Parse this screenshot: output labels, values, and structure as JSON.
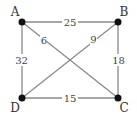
{
  "graph": {
    "nodes": [
      {
        "id": "A",
        "label": "A"
      },
      {
        "id": "B",
        "label": "B"
      },
      {
        "id": "C",
        "label": "C"
      },
      {
        "id": "D",
        "label": "D"
      }
    ],
    "edges": [
      {
        "from": "A",
        "to": "B",
        "weight": "25"
      },
      {
        "from": "B",
        "to": "C",
        "weight": "18"
      },
      {
        "from": "C",
        "to": "D",
        "weight": "15"
      },
      {
        "from": "D",
        "to": "A",
        "weight": "32"
      },
      {
        "from": "A",
        "to": "C",
        "weight": "6"
      },
      {
        "from": "B",
        "to": "D",
        "weight": "9"
      }
    ],
    "colors": {
      "node": "#111111",
      "edge": "#8a8a8a",
      "text": "#333333"
    }
  }
}
